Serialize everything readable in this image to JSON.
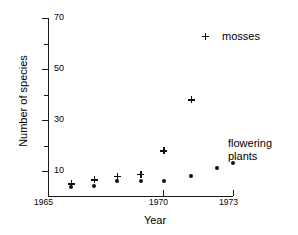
{
  "chart_data": {
    "type": "scatter",
    "title": "",
    "xlabel": "Year",
    "ylabel": "Number of species",
    "xlim": [
      1965,
      1973
    ],
    "ylim": [
      0,
      70
    ],
    "grid": false,
    "legend_position": "top-right",
    "x_ticks_labeled": [
      "1965",
      "1970",
      "1973"
    ],
    "x_ticks_values": [
      1965,
      1970,
      1973
    ],
    "y_ticks_labeled": [
      "10",
      "30",
      "50",
      "70"
    ],
    "y_ticks_values": [
      10,
      30,
      50,
      70
    ],
    "y_ticks_minor": [
      20,
      40,
      60
    ],
    "series": [
      {
        "name": "mosses",
        "marker": "plus",
        "color": "#111111",
        "points": [
          {
            "x": 1966.0,
            "y": 5.0
          },
          {
            "x": 1967.0,
            "y": 6.5
          },
          {
            "x": 1968.0,
            "y": 8.0
          },
          {
            "x": 1969.0,
            "y": 8.8
          },
          {
            "x": 1970.0,
            "y": 18.0
          },
          {
            "x": 1971.2,
            "y": 38.0
          }
        ]
      },
      {
        "name": "flowering plants",
        "marker": "dot",
        "color": "#111111",
        "points": [
          {
            "x": 1966.0,
            "y": 3.6
          },
          {
            "x": 1967.0,
            "y": 4.2
          },
          {
            "x": 1968.0,
            "y": 6.2
          },
          {
            "x": 1969.0,
            "y": 6.0
          },
          {
            "x": 1970.0,
            "y": 6.2
          },
          {
            "x": 1971.2,
            "y": 8.0
          },
          {
            "x": 1972.3,
            "y": 11.0
          },
          {
            "x": 1973.0,
            "y": 13.0
          }
        ]
      }
    ],
    "annotations": [
      {
        "name": "mosses",
        "text": "mosses"
      },
      {
        "name": "flowering-plants",
        "text_line1": "flowering",
        "text_line2": "plants"
      }
    ]
  },
  "axes": {
    "y_title": "Number of species",
    "x_title": "Year",
    "y_labels": [
      "70",
      "50",
      "30",
      "10"
    ],
    "x_labels": [
      "1965",
      "1970",
      "1973"
    ]
  },
  "legend": {
    "mosses_label": "mosses"
  },
  "annotation": {
    "flowering_line1": "flowering",
    "flowering_line2": "plants"
  }
}
